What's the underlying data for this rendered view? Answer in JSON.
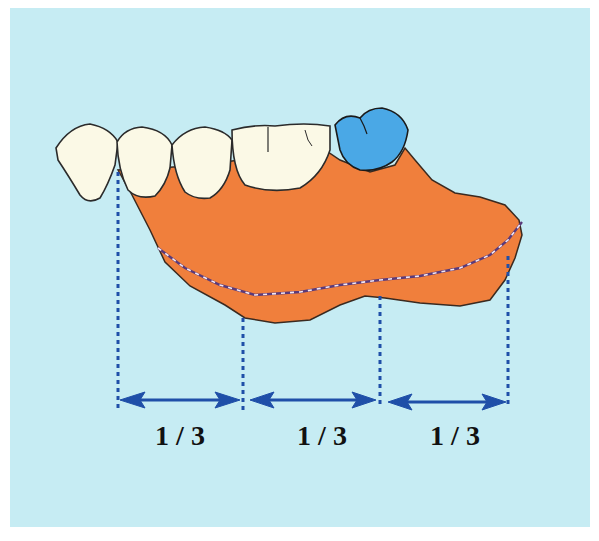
{
  "diagram": {
    "title": "",
    "colors": {
      "background": "#c6ecf3",
      "tooth_fill": "#fbf9e6",
      "tooth_outline": "#2b2b2b",
      "abutment_tooth": "#4aa8e6",
      "denture_base": "#f07f3c",
      "guide_lines": "#1f4fa8",
      "arrows": "#1f4fa8",
      "finish_line": "#e8d8f0"
    },
    "segments": [
      {
        "label": "1 / 3"
      },
      {
        "label": "1 / 3"
      },
      {
        "label": "1 / 3"
      }
    ],
    "teeth_count": 5,
    "highlighted_tooth": "last molar (blue)"
  }
}
